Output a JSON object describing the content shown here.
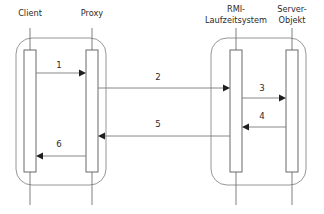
{
  "diagram": {
    "type": "uml-sequence-diagram",
    "canvas": {
      "width": 324,
      "height": 214,
      "background": "#ffffff"
    },
    "colors": {
      "line": "#7a7a7a",
      "group_box": "#8a8a8a",
      "activation_stroke": "#5a5a5a",
      "activation_fill": "#ffffff",
      "arrow_head": "#1f1f1f",
      "text": "#2b2b2b"
    },
    "groups": [
      {
        "id": "client-side",
        "x": 16,
        "y": 38,
        "width": 90,
        "height": 147,
        "rx": 16
      },
      {
        "id": "server-side",
        "x": 211,
        "y": 38,
        "width": 95,
        "height": 147,
        "rx": 16
      }
    ],
    "lifelines": [
      {
        "id": "client",
        "label_line1": "Client",
        "label_line2": "",
        "x": 30,
        "label_y1": 13,
        "head_y": 28,
        "foot_y": 205,
        "activation": {
          "x": 24,
          "y": 50,
          "width": 12,
          "height": 122
        }
      },
      {
        "id": "proxy",
        "label_line1": "Proxy",
        "label_line2": "",
        "x": 92,
        "label_y1": 13,
        "head_y": 28,
        "foot_y": 205,
        "activation": {
          "x": 86,
          "y": 50,
          "width": 12,
          "height": 122
        }
      },
      {
        "id": "rmi-runtime",
        "label_line1": "RMI-",
        "label_line2": "Laufzeitsystem",
        "x": 236,
        "label_y1": 9,
        "label_y2": 20,
        "head_y": 28,
        "foot_y": 205,
        "activation": {
          "x": 230,
          "y": 50,
          "width": 12,
          "height": 122
        }
      },
      {
        "id": "server-objekt",
        "label_line1": "Server-",
        "label_line2": "Objekt",
        "x": 292,
        "label_y1": 9,
        "label_y2": 20,
        "head_y": 28,
        "foot_y": 205,
        "activation": {
          "x": 286,
          "y": 50,
          "width": 12,
          "height": 122
        }
      }
    ],
    "messages": [
      {
        "id": "msg-1",
        "label": "1",
        "from": "client",
        "to": "proxy",
        "direction": "right",
        "x1": 36,
        "x2": 86,
        "y": 73,
        "label_x": 59,
        "label_y": 68
      },
      {
        "id": "msg-2",
        "label": "2",
        "from": "proxy",
        "to": "rmi-runtime",
        "direction": "right",
        "x1": 98,
        "x2": 230,
        "y": 88,
        "label_x": 158,
        "label_y": 80
      },
      {
        "id": "msg-3",
        "label": "3",
        "from": "rmi-runtime",
        "to": "server-objekt",
        "direction": "right",
        "x1": 242,
        "x2": 286,
        "y": 98,
        "label_x": 262,
        "label_y": 91
      },
      {
        "id": "msg-4",
        "label": "4",
        "from": "server-objekt",
        "to": "rmi-runtime",
        "direction": "left",
        "x1": 286,
        "x2": 242,
        "y": 127,
        "label_x": 262,
        "label_y": 119
      },
      {
        "id": "msg-5",
        "label": "5",
        "from": "rmi-runtime",
        "to": "proxy",
        "direction": "left",
        "x1": 230,
        "x2": 98,
        "y": 136,
        "label_x": 158,
        "label_y": 127
      },
      {
        "id": "msg-6",
        "label": "6",
        "from": "proxy",
        "to": "client",
        "direction": "left",
        "x1": 86,
        "x2": 36,
        "y": 156,
        "label_x": 59,
        "label_y": 147
      }
    ]
  }
}
